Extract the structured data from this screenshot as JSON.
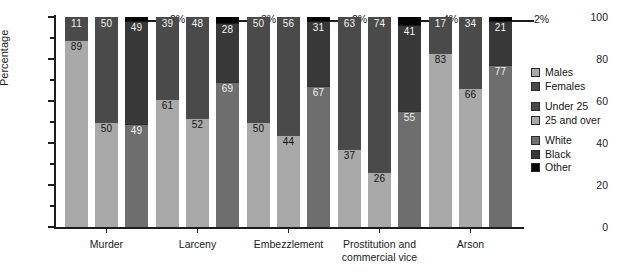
{
  "chart_data": {
    "type": "bar",
    "subtype": "grouped-stacked-percentage",
    "title": "",
    "xlabel": "",
    "ylabel": "Percentage",
    "ylim": [
      0,
      100
    ],
    "yticks": [
      0,
      20,
      40,
      60,
      80,
      100
    ],
    "yticklabels": [
      "0",
      "20",
      "40",
      "60",
      "80",
      "100"
    ],
    "yminorticks": [
      10,
      30,
      50,
      70,
      90
    ],
    "grid": false,
    "legend_position": "right",
    "categories": [
      "Murder",
      "Larceny",
      "Embezzlement",
      "Prostitution and\ncommercial vice",
      "Arson"
    ],
    "legend": [
      {
        "name": "Males",
        "color": "#a9a9a9"
      },
      {
        "name": "Females",
        "color": "#4a4a4a"
      },
      {
        "name": "Under 25",
        "color": "#4a4a4a"
      },
      {
        "name": "25 and over",
        "color": "#a9a9a9"
      },
      {
        "name": "White",
        "color": "#6e6e6e"
      },
      {
        "name": "Black",
        "color": "#383838"
      },
      {
        "name": "Other",
        "color": "#050505"
      }
    ],
    "series": [
      {
        "name": "Males",
        "values": [
          89,
          61,
          50,
          37,
          83
        ]
      },
      {
        "name": "Females",
        "values": [
          11,
          39,
          50,
          63,
          17
        ]
      },
      {
        "name": "Under 25",
        "values": [
          50,
          48,
          56,
          74,
          34
        ]
      },
      {
        "name": "25 and over",
        "values": [
          50,
          52,
          44,
          26,
          66
        ]
      },
      {
        "name": "White",
        "values": [
          49,
          69,
          67,
          55,
          77
        ]
      },
      {
        "name": "Black",
        "values": [
          49,
          28,
          31,
          41,
          21
        ]
      },
      {
        "name": "Other",
        "values": [
          2,
          3,
          2,
          4,
          2
        ]
      }
    ],
    "groups": [
      {
        "category": "Murder",
        "bars": [
          {
            "name": "sex",
            "segments": [
              {
                "label": "Females",
                "value": 11,
                "text": "11"
              },
              {
                "label": "Males",
                "value": 89,
                "text": "89"
              }
            ]
          },
          {
            "name": "age",
            "segments": [
              {
                "label": "Under 25",
                "value": 50,
                "text": "50"
              },
              {
                "label": "25 and over",
                "value": 50,
                "text": "50"
              }
            ]
          },
          {
            "name": "race",
            "segments": [
              {
                "label": "Other",
                "value": 2,
                "text": "2%"
              },
              {
                "label": "Black",
                "value": 49,
                "text": "49"
              },
              {
                "label": "White",
                "value": 49,
                "text": "49"
              }
            ]
          }
        ]
      },
      {
        "category": "Larceny",
        "bars": [
          {
            "name": "sex",
            "segments": [
              {
                "label": "Females",
                "value": 39,
                "text": "39"
              },
              {
                "label": "Males",
                "value": 61,
                "text": "61"
              }
            ]
          },
          {
            "name": "age",
            "segments": [
              {
                "label": "Under 25",
                "value": 48,
                "text": "48"
              },
              {
                "label": "25 and over",
                "value": 52,
                "text": "52"
              }
            ]
          },
          {
            "name": "race",
            "segments": [
              {
                "label": "Other",
                "value": 3,
                "text": "3%"
              },
              {
                "label": "Black",
                "value": 28,
                "text": "28"
              },
              {
                "label": "White",
                "value": 69,
                "text": "69"
              }
            ]
          }
        ]
      },
      {
        "category": "Embezzlement",
        "bars": [
          {
            "name": "sex",
            "segments": [
              {
                "label": "Females",
                "value": 50,
                "text": "50"
              },
              {
                "label": "Males",
                "value": 50,
                "text": "50"
              }
            ]
          },
          {
            "name": "age",
            "segments": [
              {
                "label": "Under 25",
                "value": 56,
                "text": "56"
              },
              {
                "label": "25 and over",
                "value": 44,
                "text": "44"
              }
            ]
          },
          {
            "name": "race",
            "segments": [
              {
                "label": "Other",
                "value": 2,
                "text": "2%"
              },
              {
                "label": "Black",
                "value": 31,
                "text": "31"
              },
              {
                "label": "White",
                "value": 67,
                "text": "67"
              }
            ]
          }
        ]
      },
      {
        "category": "Prostitution and commercial vice",
        "bars": [
          {
            "name": "sex",
            "segments": [
              {
                "label": "Females",
                "value": 63,
                "text": "63"
              },
              {
                "label": "Males",
                "value": 37,
                "text": "37"
              }
            ]
          },
          {
            "name": "age",
            "segments": [
              {
                "label": "Under 25",
                "value": 74,
                "text": "74"
              },
              {
                "label": "25 and over",
                "value": 26,
                "text": "26"
              }
            ]
          },
          {
            "name": "race",
            "segments": [
              {
                "label": "Other",
                "value": 4,
                "text": "4%"
              },
              {
                "label": "Black",
                "value": 41,
                "text": "41"
              },
              {
                "label": "White",
                "value": 55,
                "text": "55"
              }
            ]
          }
        ]
      },
      {
        "category": "Arson",
        "bars": [
          {
            "name": "sex",
            "segments": [
              {
                "label": "Females",
                "value": 17,
                "text": "17"
              },
              {
                "label": "Males",
                "value": 83,
                "text": "83"
              }
            ]
          },
          {
            "name": "age",
            "segments": [
              {
                "label": "Under 25",
                "value": 34,
                "text": "34"
              },
              {
                "label": "25 and over",
                "value": 66,
                "text": "66"
              }
            ]
          },
          {
            "name": "race",
            "segments": [
              {
                "label": "Other",
                "value": 2,
                "text": "2%"
              },
              {
                "label": "Black",
                "value": 21,
                "text": "21"
              },
              {
                "label": "White",
                "value": 77,
                "text": "77"
              }
            ]
          }
        ]
      }
    ]
  },
  "axis": {
    "y_title": "Percentage",
    "y_labels": [
      "100",
      "80",
      "60",
      "40",
      "20",
      "0"
    ],
    "x_labels": [
      "Murder",
      "Larceny",
      "Embezzlement",
      "Prostitution and\ncommercial vice",
      "Arson"
    ]
  },
  "legend": {
    "groups": [
      {
        "items": [
          {
            "label": "Males",
            "swatch": "#a9a9a9"
          },
          {
            "label": "Females",
            "swatch": "#4a4a4a"
          }
        ]
      },
      {
        "items": [
          {
            "label": "Under 25",
            "swatch": "#4a4a4a"
          },
          {
            "label": "25 and over",
            "swatch": "#a9a9a9"
          }
        ]
      },
      {
        "items": [
          {
            "label": "White",
            "swatch": "#6e6e6e"
          },
          {
            "label": "Black",
            "swatch": "#383838"
          },
          {
            "label": "Other",
            "swatch": "#050505"
          }
        ]
      }
    ]
  }
}
